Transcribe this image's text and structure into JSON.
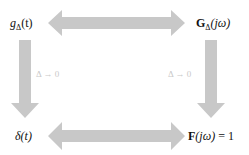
{
  "diagram": {
    "nodes": {
      "top_left": {
        "base": "g",
        "sub": "Δ",
        "arg": "(t)"
      },
      "top_right": {
        "base": "G",
        "sub": "Δ",
        "arg": "(jω)"
      },
      "bottom_left": {
        "text": "δ(t)"
      },
      "bottom_right": {
        "base": "F",
        "arg": "(jω)",
        "rhs": " = 1"
      }
    },
    "edges": [
      {
        "from": "top_left",
        "to": "top_right",
        "type": "bidirectional"
      },
      {
        "from": "bottom_left",
        "to": "bottom_right",
        "type": "bidirectional"
      },
      {
        "from": "top_left",
        "to": "bottom_left",
        "type": "directed",
        "label": "Δ → 0"
      },
      {
        "from": "top_right",
        "to": "bottom_right",
        "type": "directed",
        "label": "Δ → 0"
      }
    ],
    "labels": {
      "left_limit": "Δ → 0",
      "right_limit": "Δ → 0"
    },
    "colors": {
      "arrow": "#c8c8c8",
      "label": "#c9c9c9",
      "text": "#111111"
    }
  }
}
